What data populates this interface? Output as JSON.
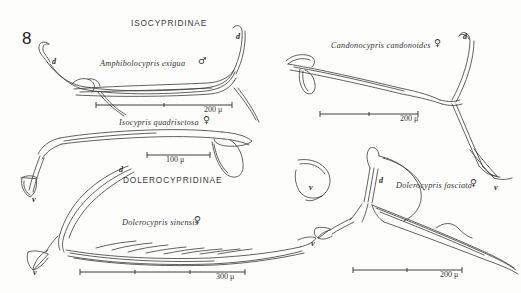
{
  "figure": {
    "number": "8",
    "caption_present": false
  },
  "subfamilies": [
    {
      "id": "isocypridinae",
      "label": "ISOCYPRIDINAE",
      "x": 131,
      "y": 19
    },
    {
      "id": "dolerocypridinae",
      "label": "DOLEROCYPRIDINAE",
      "x": 123,
      "y": 176
    }
  ],
  "species": [
    {
      "id": "amphibolocypris-exigua",
      "name": "Amphibolocypris exigua",
      "sex": "♂",
      "sex_name": "male",
      "x": 100,
      "y": 60,
      "sex_x": 198,
      "sex_y": 58
    },
    {
      "id": "isocypris-quadrisetosa",
      "name": "Isocypris quadrisetosa",
      "sex": "♀",
      "sex_name": "female",
      "x": 119,
      "y": 119,
      "sex_x": 203,
      "sex_y": 117
    },
    {
      "id": "candonocypris-candonoides",
      "name": "Candonocypris candonoides",
      "sex": "♀",
      "sex_name": "female",
      "x": 331,
      "y": 42,
      "sex_x": 434,
      "sex_y": 40
    },
    {
      "id": "dolerocypris-sinensis",
      "name": "Dolerocypris sinensis",
      "sex": "♀",
      "sex_name": "female",
      "x": 122,
      "y": 219,
      "sex_x": 194,
      "sex_y": 217
    },
    {
      "id": "dolerocypris-fasciata",
      "name": "Dolerocypris fasciata",
      "sex": "♀",
      "sex_name": "female",
      "x": 396,
      "y": 182,
      "sex_x": 470,
      "sex_y": 180
    }
  ],
  "view_labels": [
    {
      "id": "d-1",
      "text": "d",
      "x": 52,
      "y": 58
    },
    {
      "id": "d-2",
      "text": "d",
      "x": 236,
      "y": 33
    },
    {
      "id": "d-3",
      "text": "d",
      "x": 463,
      "y": 33
    },
    {
      "id": "d-4",
      "text": "d",
      "x": 119,
      "y": 166
    },
    {
      "id": "d-5",
      "text": "d",
      "x": 379,
      "y": 177
    },
    {
      "id": "v-1",
      "text": "v",
      "x": 32,
      "y": 196
    },
    {
      "id": "v-2",
      "text": "v",
      "x": 33,
      "y": 269
    },
    {
      "id": "v-3",
      "text": "v",
      "x": 309,
      "y": 184
    },
    {
      "id": "v-4",
      "text": "v",
      "x": 311,
      "y": 240
    },
    {
      "id": "v-5",
      "text": "v",
      "x": 494,
      "y": 184
    }
  ],
  "scale_bars": [
    {
      "id": "scale-200u-top-left",
      "value": "200",
      "unit": "μ",
      "label": "200 μ",
      "x1": 96,
      "x2": 232,
      "y": 105,
      "text_x": 222,
      "text_y": 108
    },
    {
      "id": "scale-100u-mid-left",
      "value": "100",
      "unit": "μ",
      "label": "100 μ",
      "x1": 147,
      "x2": 210,
      "y": 155,
      "text_x": 180,
      "text_y": 157
    },
    {
      "id": "scale-300u-bottom-left",
      "value": "300",
      "unit": "μ",
      "label": "300 μ",
      "x1": 80,
      "x2": 245,
      "y": 272,
      "text_x": 222,
      "text_y": 274
    },
    {
      "id": "scale-200u-top-right",
      "value": "200",
      "unit": "μ",
      "label": "200 μ",
      "x1": 320,
      "x2": 418,
      "y": 114,
      "text_x": 409,
      "text_y": 117
    },
    {
      "id": "scale-200u-bottom-right",
      "value": "200",
      "unit": "μ",
      "label": "200 μ",
      "x1": 353,
      "x2": 462,
      "y": 270,
      "text_x": 452,
      "text_y": 272
    }
  ],
  "colors": {
    "background": "#fdfdfc",
    "ink": "#2b2b2b",
    "line": "#3a3a3a"
  }
}
